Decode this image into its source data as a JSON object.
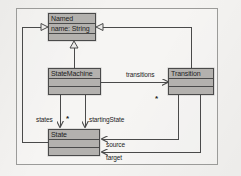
{
  "diagram": {
    "kind": "uml-class-diagram",
    "frame": {
      "x": 16,
      "y": 8,
      "width": 202,
      "height": 157
    },
    "colors": {
      "page_background": "#f3f2f0",
      "class_fill": "#b3b1ae",
      "line": "#4a4a4a",
      "frame_border": "#9b9b99",
      "text": "#1d1d1d"
    }
  },
  "classes": [
    {
      "id": "named",
      "name": "Named",
      "attributes": "name: String",
      "x": 48,
      "y": 13,
      "width": 48,
      "height": 28,
      "compartments": [
        "Named",
        "name: String",
        ""
      ]
    },
    {
      "id": "statemachine",
      "name": "StateMachine",
      "x": 48,
      "y": 68,
      "width": 53,
      "height": 27,
      "compartments": [
        "StateMachine",
        "",
        ""
      ]
    },
    {
      "id": "transition",
      "name": "Transition",
      "x": 168,
      "y": 68,
      "width": 46,
      "height": 27,
      "compartments": [
        "Transition",
        "",
        ""
      ]
    },
    {
      "id": "state",
      "name": "State",
      "x": 48,
      "y": 129,
      "width": 52,
      "height": 27,
      "compartments": [
        "State",
        "",
        ""
      ]
    }
  ],
  "generalizations": [
    {
      "id": "gen-statemachine-named",
      "from": "StateMachine",
      "to": "Named",
      "arrow": "hollow-triangle",
      "direction": "up"
    },
    {
      "id": "gen-transition-named",
      "from": "Transition",
      "to": "Named",
      "arrow": "hollow-triangle",
      "direction": "left"
    },
    {
      "id": "gen-state-named",
      "from": "State",
      "to": "Named",
      "arrow": "hollow-triangle",
      "direction": "right"
    }
  ],
  "associations": [
    {
      "id": "assoc-transitions",
      "label": "transitions",
      "multiplicity": "*",
      "from": "StateMachine",
      "to": "Transition"
    },
    {
      "id": "assoc-states",
      "label": "states",
      "multiplicity": "*",
      "from": "StateMachine",
      "to": "State"
    },
    {
      "id": "assoc-startingstate",
      "label": "startingState",
      "multiplicity": "",
      "from": "StateMachine",
      "to": "State"
    },
    {
      "id": "assoc-source",
      "label": "source",
      "multiplicity": "",
      "from": "Transition",
      "to": "State"
    },
    {
      "id": "assoc-target",
      "label": "target",
      "multiplicity": "",
      "from": "Transition",
      "to": "State"
    }
  ],
  "labels": {
    "transitions": "transitions",
    "transitions_mult": "*",
    "states": "states",
    "states_mult": "*",
    "startingState": "startingState",
    "source": "source",
    "target": "target"
  }
}
